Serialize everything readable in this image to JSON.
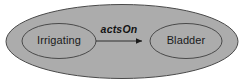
{
  "diagram": {
    "type": "ellipse-containment-graph",
    "background_color": "#ffffff",
    "fill_color": "#acacac",
    "stroke_color": "#4a4a4a",
    "text_color": "#1a1a1a",
    "container": {
      "name": "outer-ellipse",
      "label": "",
      "cx": 122,
      "cy": 41.5,
      "rx": 116,
      "ry": 37
    },
    "nodes": [
      {
        "id": "irrigating",
        "label": "Irrigating",
        "cx": 59,
        "cy": 41,
        "rx": 37,
        "ry": 17.5
      },
      {
        "id": "bladder",
        "label": "Bladder",
        "cx": 186,
        "cy": 41,
        "rx": 36,
        "ry": 17.5
      }
    ],
    "edges": [
      {
        "id": "actson",
        "label": "actsOn",
        "from": "irrigating",
        "to": "bladder",
        "arrowhead": "filled-triangle",
        "x1": 96,
        "y1": 41,
        "x2": 142,
        "y2": 41,
        "label_x": 119,
        "label_y": 33
      }
    ]
  }
}
